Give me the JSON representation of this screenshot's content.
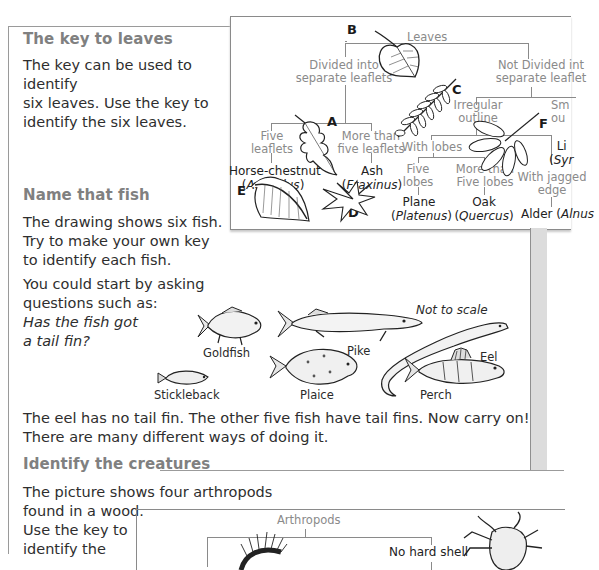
{
  "sections": {
    "leaves": {
      "heading": "The key to leaves",
      "body": "The key can be used to identify six leaves. Use the key to identify the six leaves.",
      "lines": [
        "The key can be used to identify",
        "six leaves. Use the key to",
        "identify the six leaves."
      ]
    },
    "fish": {
      "heading": "Name that fish",
      "body_lines": [
        "The drawing shows six fish.",
        "Try to make your own key",
        "to identify each fish."
      ],
      "prompt_lines": [
        "You could start by asking",
        "questions such as:"
      ],
      "question_lines": [
        "Has the fish got",
        "a tail fin?"
      ],
      "followup_lines": [
        "The eel has no tail fin. The other five fish have tail fins. Now carry on!",
        "There are many different ways of doing it."
      ]
    },
    "creatures": {
      "heading": "Identify the creatures",
      "body_lines": [
        "The picture shows four arthropods",
        "found in a wood.",
        "Use the key to",
        "identify the"
      ]
    }
  },
  "leaf_key": {
    "root": "Leaves",
    "divided": [
      "Divided into",
      "separate leaflets"
    ],
    "not_divided": [
      "Not Divided int",
      "separate leaflet"
    ],
    "five_leaflets": [
      "Five",
      "leaflets"
    ],
    "more_than_five_leaflets": [
      "More than",
      "five leaflets"
    ],
    "irregular_outline": [
      "Irregular",
      "outline"
    ],
    "smooth_outline": [
      "Sm",
      "ou"
    ],
    "with_lobes": "With lobes",
    "five_lobes": [
      "Five",
      "lobes"
    ],
    "more_than_five_lobes": [
      "More than",
      "Five lobes"
    ],
    "jagged_edge": [
      "With jagged",
      "edge"
    ],
    "results": {
      "horse_chestnut": {
        "common": "Horse-chestnut",
        "latin": "Aesculus"
      },
      "ash": {
        "common": "Ash",
        "latin": "Fraxinus"
      },
      "plane": {
        "common": "Plane",
        "latin": "Platenus"
      },
      "oak": {
        "common": "Oak",
        "latin": "Quercus"
      },
      "alder": {
        "common": "Alder",
        "latin": "Alnus"
      },
      "lilac": {
        "common": "Li",
        "latin": "Syr"
      }
    },
    "leaf_letters": [
      "A",
      "B",
      "C",
      "D",
      "E",
      "F"
    ]
  },
  "fish_drawing": {
    "note": "Not to scale",
    "labels": [
      "Goldfish",
      "Pike",
      "Eel",
      "Stickleback",
      "Plaice",
      "Perch"
    ]
  },
  "arthropod_key": {
    "root": "Arthropods",
    "branch_no_shell": "No hard shell"
  }
}
